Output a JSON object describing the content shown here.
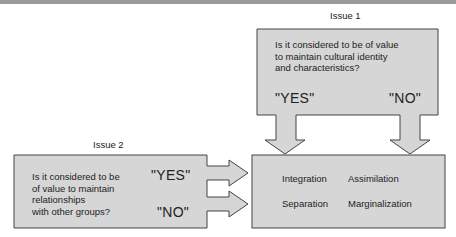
{
  "issue1": {
    "title": "Issue 1",
    "question_lines": [
      "Is it considered to be of value",
      "to maintain cultural identity",
      "and characteristics?"
    ],
    "yes_label": "\"YES\"",
    "no_label": "\"NO\""
  },
  "issue2": {
    "title": "Issue 2",
    "question_lines": [
      "Is it considered to be",
      "of value to maintain",
      "relationships",
      "with other groups?"
    ],
    "yes_label": "\"YES\"",
    "no_label": "\"NO\""
  },
  "outcomes": {
    "top_left": "Integration",
    "top_right": "Assimilation",
    "bottom_left": "Separation",
    "bottom_right": "Marginalization"
  },
  "colors": {
    "box_fill": "#d6d6d6",
    "stroke": "#444444",
    "background": "#ffffff"
  }
}
